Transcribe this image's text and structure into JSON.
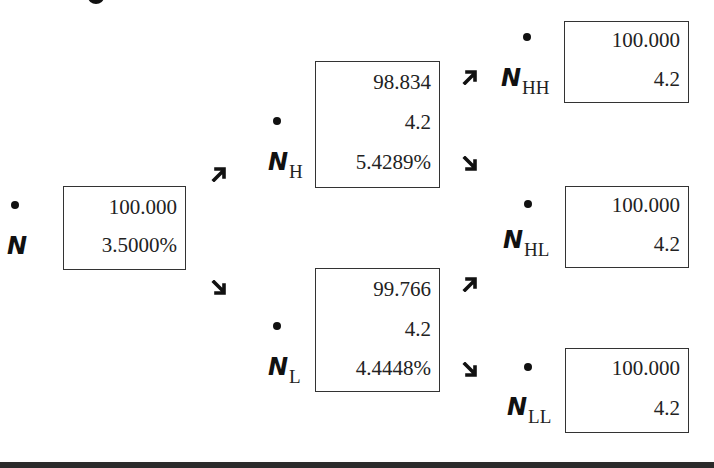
{
  "diagram": {
    "type": "binomial-tree",
    "colors": {
      "text": "#222222",
      "border": "#333333",
      "glyph": "#111111",
      "bottom_bar": "#2b2b2b"
    },
    "nodes": {
      "N": {
        "symbol": "N",
        "subscript": "",
        "values": [
          "100.000",
          "3.5000%"
        ]
      },
      "NH": {
        "symbol": "N",
        "subscript": "H",
        "values": [
          "98.834",
          "4.2",
          "5.4289%"
        ]
      },
      "NL": {
        "symbol": "N",
        "subscript": "L",
        "values": [
          "99.766",
          "4.2",
          "4.4448%"
        ]
      },
      "NHH": {
        "symbol": "N",
        "subscript": "HH",
        "values": [
          "100.000",
          "4.2"
        ]
      },
      "NHL": {
        "symbol": "N",
        "subscript": "HL",
        "values": [
          "100.000",
          "4.2"
        ]
      },
      "NLL": {
        "symbol": "N",
        "subscript": "LL",
        "values": [
          "100.000",
          "4.2"
        ]
      }
    },
    "edges": [
      {
        "from": "N",
        "to": "NH",
        "arrow": "up-right-arrow"
      },
      {
        "from": "N",
        "to": "NL",
        "arrow": "down-right-arrow"
      },
      {
        "from": "NH",
        "to": "NHH",
        "arrow": "up-right-arrow"
      },
      {
        "from": "NH",
        "to": "NHL",
        "arrow": "down-right-arrow"
      },
      {
        "from": "NL",
        "to": "NHL",
        "arrow": "up-right-arrow"
      },
      {
        "from": "NL",
        "to": "NLL",
        "arrow": "down-right-arrow"
      }
    ]
  }
}
